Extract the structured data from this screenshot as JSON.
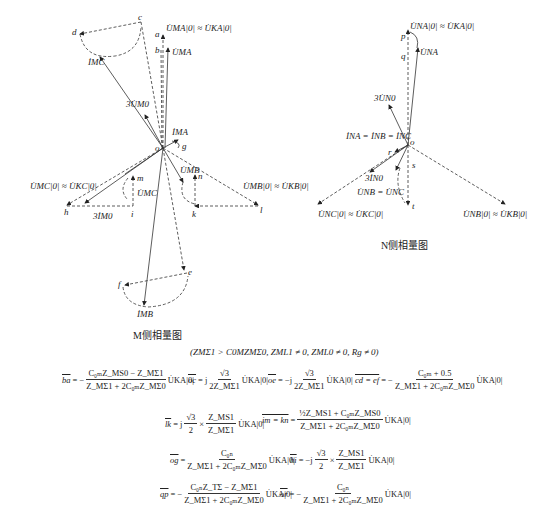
{
  "diagram": {
    "m_side": {
      "caption": "M侧相量图",
      "origin": "o",
      "points": [
        "a",
        "b",
        "c",
        "d",
        "e",
        "f",
        "g",
        "h",
        "i",
        "k",
        "l",
        "m",
        "n"
      ],
      "labels": {
        "u_ma0": "U̇MA|0| ≈ U̇KA|0|",
        "u_ma": "U̇MA",
        "i_mc": "İMC",
        "three_u_m0": "3U̇M0",
        "i_ma": "İMA",
        "u_mc0": "U̇MC|0| ≈ U̇KC|0|",
        "u_mc": "U̇MC",
        "three_i_m0": "3İM0",
        "u_mb": "U̇MB",
        "u_mb0": "U̇MB|0| ≈ U̇KB|0|",
        "i_mb": "İMB"
      }
    },
    "n_side": {
      "caption": "N侧相量图",
      "origin": "o",
      "points": [
        "p",
        "q",
        "r",
        "s",
        "t"
      ],
      "labels": {
        "u_na0": "U̇NA|0| ≈ U̇KA|0|",
        "u_na": "U̇NA",
        "three_u_n0": "3U̇N0",
        "i_n_all": "İNA = İNB = İNC",
        "three_i_n0": "3İN0",
        "u_nb_nc": "U̇NB = U̇NC",
        "u_nc0": "U̇NC|0| ≈ U̇KC|0|",
        "u_nb0": "U̇NB|0| ≈ U̇KB|0|"
      }
    },
    "conditions": "(ZMΣ1 > C0MZMΣ0, ZML1 ≠ 0, ZML0 ≠ 0, Rg ≠ 0)",
    "equations": [
      {
        "lhs": "ba",
        "rhs": "− (C0MZMΣ0 − ZMΣ1) / (ZMΣ1 + 2C0MZMΣ0) · U̇KA|0|"
      },
      {
        "lhs": "oc",
        "rhs": "j √3 / (2ZMΣ1) · U̇KA|0|"
      },
      {
        "lhs": "oe",
        "rhs": "−j √3 / (2ZMΣ1) · U̇KA|0|"
      },
      {
        "lhs": "cd = ef",
        "rhs": "− (C0M + 0.5) / (ZMΣ1 + 2C0MZMΣ0) · U̇KA|0|"
      },
      {
        "lhs": "lk",
        "rhs": "j √3/2 × ZMS1/ZMΣ1 · U̇KA|0|"
      },
      {
        "lhs": "im = kn",
        "rhs": "(½ZMS1 + C0MZMS0) / (ZMΣ1 + 2C0MZMΣ0) · U̇KA|0|"
      },
      {
        "lhs": "og",
        "rhs": "C0N / (ZMΣ1 + 2C0MZMΣ0) · U̇KA|0|"
      },
      {
        "lhs": "hi",
        "rhs": "−j √3/2 × ZMS1/ZMΣ1 · U̇KA|0|"
      },
      {
        "lhs": "qp",
        "rhs": "− (C0NZTΣ − ZMΣ1) / (ZMΣ1 + 2C0MZMΣ0) · U̇KA|0|"
      },
      {
        "lhs": "or",
        "rhs": "− C0N / (ZMΣ1 + 2C0MZMΣ0) · U̇KA|0|"
      }
    ]
  },
  "eq": {
    "ba": {
      "lhs": "ba",
      "sign": "= −",
      "num": "C₀ₘZ_MS0 − Z_MΣ1",
      "den": "Z_MΣ1 + 2C₀ₘZ_MΣ0",
      "tail": "U̇KA|0|"
    },
    "oc": {
      "lhs": "oc",
      "sign": "= j",
      "num": "√3",
      "den": "2Z_MΣ1",
      "tail": "U̇KA|0|"
    },
    "oe": {
      "lhs": "oe",
      "sign": "= −j",
      "num": "√3",
      "den": "2Z_MΣ1",
      "tail": "U̇KA|0|"
    },
    "cd": {
      "lhs": "cd = ef",
      "sign": "= −",
      "num": "C₀ₘ + 0.5",
      "den": "Z_MΣ1 + 2C₀ₘZ_MΣ0",
      "tail": "U̇KA|0|"
    },
    "lk": {
      "lhs": "lk",
      "sign": "= j",
      "num": "√3",
      "den": "2",
      "x": "×",
      "num2": "Z_MS1",
      "den2": "Z_MΣ1",
      "tail": "U̇KA|0|"
    },
    "im": {
      "lhs": "im = kn",
      "sign": "=",
      "num": "½Z_MS1 + C₀ₘZ_MS0",
      "den": "Z_MΣ1 + 2C₀ₘZ_MΣ0",
      "tail": "U̇KA|0|"
    },
    "og": {
      "lhs": "og",
      "sign": "=",
      "num": "C₀ₙ",
      "den": "Z_MΣ1 + 2C₀ₘZ_MΣ0",
      "tail": "U̇KA|0|"
    },
    "hi": {
      "lhs": "hi",
      "sign": "= −j",
      "num": "√3",
      "den": "2",
      "x": "×",
      "num2": "Z_MS1",
      "den2": "Z_MΣ1",
      "tail": "U̇KA|0|"
    },
    "qp": {
      "lhs": "qp",
      "sign": "= −",
      "num": "C₀ₙZ_TΣ − Z_MΣ1",
      "den": "Z_MΣ1 + 2C₀ₘZ_MΣ0",
      "tail": "U̇KA|0|"
    },
    "or": {
      "lhs": "or",
      "sign": "= −",
      "num": "C₀ₙ",
      "den": "Z_MΣ1 + 2C₀ₘZ_MΣ0",
      "tail": "U̇KA|0|"
    }
  }
}
